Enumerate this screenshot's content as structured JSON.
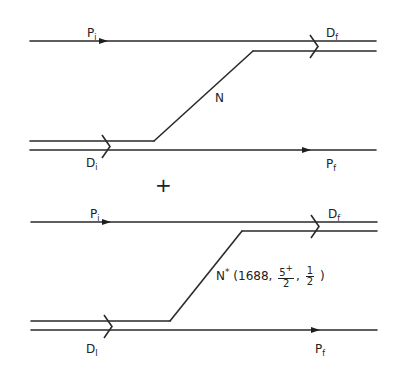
{
  "figure": {
    "width": 398,
    "height": 373,
    "stroke_color": "#2a2a2a",
    "background": "#ffffff",
    "combine_symbol": "+"
  },
  "diagrams": [
    {
      "id": "top",
      "lines": {
        "upper_proton": {
          "x1": 30,
          "x2": 376,
          "y": 41
        },
        "upper_exchange": {
          "x1": 253,
          "x2": 376,
          "y": 51
        },
        "lower_exchange": {
          "x1": 30,
          "x2": 154,
          "y": 141
        },
        "lower_proton": {
          "x1": 30,
          "x2": 376,
          "y": 150
        },
        "diagonal": {
          "x1": 154,
          "y1": 141,
          "x2": 253,
          "y2": 51
        }
      },
      "arrows": [
        {
          "x": 105,
          "y": 41
        },
        {
          "x": 308,
          "y": 150
        }
      ],
      "chevrons": [
        {
          "x": 106,
          "y_top": 135,
          "y_bottom": 158
        },
        {
          "x": 314,
          "y_top": 35,
          "y_bottom": 58
        }
      ],
      "labels": {
        "p_initial": {
          "base": "P",
          "sub": "i",
          "x": 87,
          "y": 27
        },
        "d_final": {
          "base": "D",
          "sub": "f",
          "x": 326,
          "y": 27
        },
        "intermediate": {
          "text": "N",
          "x": 215,
          "y": 92
        },
        "d_initial": {
          "base": "D",
          "sub": "i",
          "x": 86,
          "y": 157
        },
        "p_final": {
          "base": "P",
          "sub": "f",
          "x": 326,
          "y": 158
        }
      }
    },
    {
      "id": "bottom",
      "lines": {
        "upper_proton": {
          "x1": 31,
          "x2": 377,
          "y": 222
        },
        "upper_exchange": {
          "x1": 242,
          "x2": 377,
          "y": 231
        },
        "lower_exchange": {
          "x1": 31,
          "x2": 170,
          "y": 321
        },
        "lower_proton": {
          "x1": 31,
          "x2": 377,
          "y": 330
        },
        "diagonal": {
          "x1": 170,
          "y1": 321,
          "x2": 242,
          "y2": 231
        }
      },
      "arrows": [
        {
          "x": 108,
          "y": 222
        },
        {
          "x": 317,
          "y": 330
        }
      ],
      "chevrons": [
        {
          "x": 108,
          "y_top": 315,
          "y_bottom": 338
        },
        {
          "x": 315,
          "y_top": 215,
          "y_bottom": 238
        }
      ],
      "labels": {
        "p_initial": {
          "base": "P",
          "sub": "i",
          "x": 90,
          "y": 208
        },
        "d_final": {
          "base": "D",
          "sub": "f",
          "x": 328,
          "y": 208
        },
        "intermediate": {
          "base": "N",
          "sup": "*",
          "open": "(1688,",
          "frac1_num": "5",
          "frac1_sup": "+",
          "frac1_den": "2",
          "sep": ",",
          "frac2_num": "1",
          "frac2_den": "2",
          "close": ")",
          "x": 216,
          "y": 263
        },
        "d_initial": {
          "base": "D",
          "sub": "I",
          "x": 86,
          "y": 343
        },
        "p_final": {
          "base": "P",
          "sub": "f",
          "x": 315,
          "y": 343
        }
      }
    }
  ],
  "plus": {
    "text": "+",
    "x": 155,
    "y": 175
  }
}
